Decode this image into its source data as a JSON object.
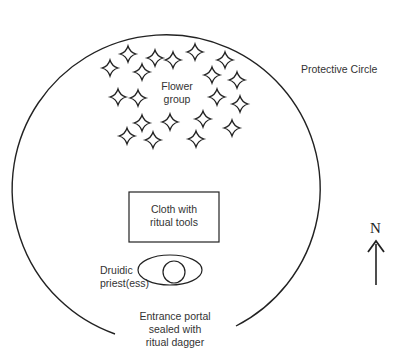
{
  "diagram": {
    "type": "ritual-layout",
    "labels": {
      "protective_circle": "Protective Circle",
      "flower_group_1": "Flower",
      "flower_group_2": "group",
      "cloth_1": "Cloth with",
      "cloth_2": "ritual tools",
      "priest_1": "Druidic",
      "priest_2": "priest(ess)",
      "entrance_1": "Entrance portal",
      "entrance_2": "sealed with",
      "entrance_3": "ritual dagger",
      "north": "N"
    },
    "stars": [
      [
        128,
        54
      ],
      [
        110,
        68
      ],
      [
        155,
        58
      ],
      [
        142,
        72
      ],
      [
        173,
        60
      ],
      [
        195,
        52
      ],
      [
        225,
        60
      ],
      [
        212,
        75
      ],
      [
        237,
        80
      ],
      [
        118,
        97
      ],
      [
        138,
        98
      ],
      [
        217,
        97
      ],
      [
        240,
        104
      ],
      [
        142,
        123
      ],
      [
        170,
        122
      ],
      [
        203,
        119
      ],
      [
        232,
        128
      ],
      [
        127,
        136
      ],
      [
        153,
        140
      ],
      [
        196,
        139
      ]
    ],
    "colors": {
      "stroke": "#222222",
      "text": "#333333",
      "background": "#ffffff"
    }
  }
}
